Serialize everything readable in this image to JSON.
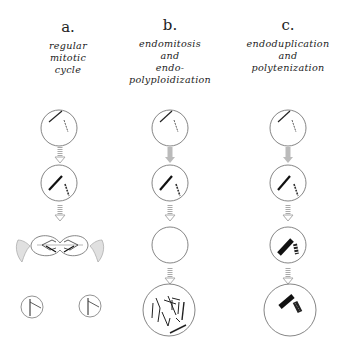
{
  "columns": [
    {
      "letter": "a.",
      "label_lines": [
        "regular",
        "mitotic",
        "cycle"
      ],
      "stages": [
        "interphase-cell",
        "g2-cell",
        "dividing-cell",
        "daughter-cells"
      ]
    },
    {
      "letter": "b.",
      "label_lines": [
        "endomitosis",
        "and",
        "endo-",
        "polyploidization"
      ],
      "stages": [
        "interphase-cell",
        "g2-cell",
        "empty-cell",
        "polyploid-cell"
      ]
    },
    {
      "letter": "c.",
      "label_lines": [
        "endoduplication",
        "and",
        "polytenization"
      ],
      "stages": [
        "interphase-cell",
        "g2-cell",
        "polytene-cell",
        "polytene-cell-large"
      ]
    }
  ],
  "colors": {
    "stroke": "#555555",
    "chromosome": "#222222",
    "arrow": "#aaaaaa"
  }
}
